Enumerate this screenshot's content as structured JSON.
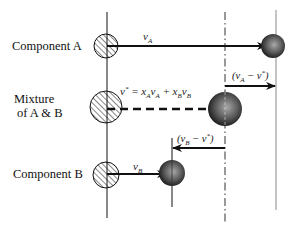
{
  "diagram": {
    "rows": {
      "component_a": {
        "label": "Component A",
        "velocity_label": "v",
        "velocity_sub": "A"
      },
      "mixture": {
        "label_line1": "Mixture",
        "label_line2": "of A & B",
        "equation": {
          "lhs": "v",
          "lhs_sup": "*",
          "eq": " = ",
          "x1": "x",
          "x1_sub": "A",
          "v1": "v",
          "v1_sub": "A",
          "plus": " + ",
          "x2": "x",
          "x2_sub": "B",
          "v2": "v",
          "v2_sub": "B"
        },
        "diff_a": {
          "open": "(",
          "v": "v",
          "v_sub": "A",
          "minus": " − ",
          "vstar": "v",
          "vstar_sup": "*",
          "close": ")"
        }
      },
      "component_b": {
        "label": "Component B",
        "velocity_label": "v",
        "velocity_sub": "B",
        "diff_b": {
          "open": "(",
          "v": "v",
          "v_sub": "B",
          "minus": " − ",
          "vstar": "v",
          "vstar_sup": "*",
          "close": ")"
        }
      }
    },
    "colors": {
      "line": "#111111",
      "reference_line": "#555555",
      "ref_gray": "#888888",
      "sphere_dark": "#1a1a1a",
      "sphere_light": "#9a9a9a"
    }
  }
}
